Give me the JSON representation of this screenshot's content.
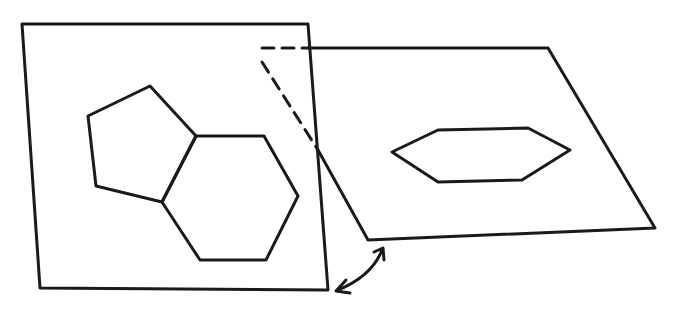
{
  "diagram": {
    "ink_color": "#1a1a1a",
    "background": "#ffffff",
    "elements": [
      {
        "id": "left-plane",
        "shape": "quadrilateral",
        "points": [
          [
            22,
            24
          ],
          [
            308,
            24
          ],
          [
            328,
            290
          ],
          [
            40,
            288
          ]
        ]
      },
      {
        "id": "pentagon",
        "shape": "pentagon",
        "points": [
          [
            88,
            116
          ],
          [
            150,
            86
          ],
          [
            196,
            136
          ],
          [
            162,
            202
          ],
          [
            96,
            186
          ]
        ]
      },
      {
        "id": "hexagon",
        "shape": "hexagon",
        "points": [
          [
            196,
            136
          ],
          [
            264,
            136
          ],
          [
            298,
            196
          ],
          [
            266,
            260
          ],
          [
            200,
            260
          ],
          [
            162,
            202
          ]
        ]
      },
      {
        "id": "right-plane",
        "shape": "quadrilateral",
        "points": [
          [
            308,
            48
          ],
          [
            548,
            48
          ],
          [
            655,
            228
          ],
          [
            368,
            240
          ]
        ]
      },
      {
        "id": "flat-hexagon",
        "shape": "hexagon",
        "points": [
          [
            392,
            152
          ],
          [
            438,
            130
          ],
          [
            528,
            128
          ],
          [
            570,
            150
          ],
          [
            522,
            180
          ],
          [
            438,
            182
          ]
        ]
      },
      {
        "id": "hidden-edge-top",
        "shape": "dashed-line",
        "points": [
          [
            262,
            48
          ],
          [
            308,
            48
          ]
        ]
      },
      {
        "id": "hidden-edge-diagonal",
        "shape": "dashed-line",
        "points": [
          [
            262,
            62
          ],
          [
            318,
            150
          ]
        ]
      },
      {
        "id": "rotation-arrow",
        "shape": "curved-double-arrow",
        "points": [
          [
            336,
            292
          ],
          [
            384,
            248
          ]
        ]
      }
    ]
  }
}
